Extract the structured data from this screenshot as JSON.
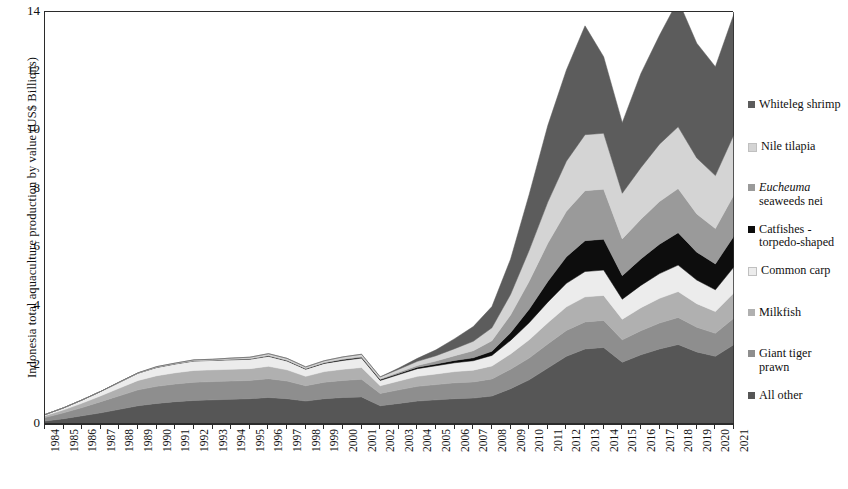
{
  "chart_data": {
    "type": "area",
    "stacked": true,
    "title": "",
    "xlabel": "",
    "ylabel": "Indonesia total aquaculture production by value (US$ Billions)",
    "ylim": [
      0,
      14
    ],
    "yticks": [
      0,
      2,
      4,
      6,
      8,
      10,
      12,
      14
    ],
    "grid": false,
    "legend_position": "right",
    "categories": [
      "1984",
      "1985",
      "1986",
      "1987",
      "1988",
      "1989",
      "1990",
      "1991",
      "1992",
      "1993",
      "1994",
      "1995",
      "1996",
      "1997",
      "1998",
      "1999",
      "2000",
      "2001",
      "2002",
      "2003",
      "2004",
      "2005",
      "2006",
      "2007",
      "2008",
      "2009",
      "2010",
      "2011",
      "2012",
      "2013",
      "2014",
      "2015",
      "2016",
      "2017",
      "2018",
      "2019",
      "2020",
      "2021"
    ],
    "stack_order_bottom_to_top": [
      "All other",
      "Giant tiger prawn",
      "Milkfish",
      "Common carp",
      "Catfishes - torpedo-shaped",
      "Eucheuma seaweeds nei",
      "Nile tilapia",
      "Whiteleg shrimp"
    ],
    "series": [
      {
        "name": "All other",
        "color": "#565656",
        "values": [
          0.1,
          0.18,
          0.28,
          0.38,
          0.5,
          0.62,
          0.7,
          0.76,
          0.8,
          0.82,
          0.84,
          0.86,
          0.9,
          0.86,
          0.78,
          0.86,
          0.9,
          0.92,
          0.62,
          0.7,
          0.78,
          0.82,
          0.86,
          0.88,
          0.95,
          1.2,
          1.5,
          1.9,
          2.3,
          2.55,
          2.6,
          2.1,
          2.35,
          2.55,
          2.7,
          2.45,
          2.3,
          2.7
        ]
      },
      {
        "name": "Giant tiger prawn",
        "color": "#8e8e8e",
        "values": [
          0.12,
          0.2,
          0.28,
          0.38,
          0.46,
          0.54,
          0.58,
          0.6,
          0.62,
          0.62,
          0.62,
          0.62,
          0.64,
          0.6,
          0.52,
          0.56,
          0.58,
          0.6,
          0.42,
          0.46,
          0.5,
          0.52,
          0.54,
          0.55,
          0.58,
          0.66,
          0.74,
          0.82,
          0.88,
          0.92,
          0.92,
          0.76,
          0.82,
          0.88,
          0.92,
          0.84,
          0.78,
          0.9
        ]
      },
      {
        "name": "Milkfish",
        "color": "#b0b0b0",
        "values": [
          0.06,
          0.1,
          0.15,
          0.2,
          0.26,
          0.32,
          0.36,
          0.38,
          0.4,
          0.4,
          0.4,
          0.4,
          0.42,
          0.38,
          0.32,
          0.36,
          0.38,
          0.4,
          0.26,
          0.3,
          0.34,
          0.36,
          0.38,
          0.4,
          0.44,
          0.52,
          0.62,
          0.72,
          0.8,
          0.85,
          0.85,
          0.7,
          0.78,
          0.84,
          0.88,
          0.8,
          0.74,
          0.86
        ]
      },
      {
        "name": "Common carp",
        "color": "#ececec",
        "values": [
          0.04,
          0.07,
          0.11,
          0.15,
          0.2,
          0.25,
          0.28,
          0.3,
          0.32,
          0.32,
          0.32,
          0.32,
          0.34,
          0.3,
          0.24,
          0.28,
          0.3,
          0.32,
          0.18,
          0.22,
          0.26,
          0.28,
          0.3,
          0.32,
          0.36,
          0.46,
          0.58,
          0.7,
          0.8,
          0.86,
          0.86,
          0.68,
          0.76,
          0.84,
          0.9,
          0.8,
          0.74,
          0.88
        ]
      },
      {
        "name": "Catfishes - torpedo-shaped",
        "color": "#0d0d0d",
        "values": [
          0.0,
          0.0,
          0.0,
          0.0,
          0.0,
          0.0,
          0.01,
          0.01,
          0.01,
          0.01,
          0.02,
          0.02,
          0.02,
          0.02,
          0.02,
          0.02,
          0.03,
          0.03,
          0.03,
          0.04,
          0.05,
          0.06,
          0.08,
          0.1,
          0.14,
          0.26,
          0.46,
          0.7,
          0.9,
          1.05,
          1.05,
          0.8,
          0.9,
          1.0,
          1.1,
          0.95,
          0.88,
          1.05
        ]
      },
      {
        "name": "Eucheuma seaweeds nei",
        "color": "#9a9a9a",
        "values": [
          0.0,
          0.0,
          0.0,
          0.0,
          0.0,
          0.0,
          0.0,
          0.0,
          0.0,
          0.0,
          0.0,
          0.0,
          0.01,
          0.01,
          0.01,
          0.01,
          0.02,
          0.02,
          0.02,
          0.04,
          0.06,
          0.1,
          0.16,
          0.24,
          0.36,
          0.6,
          0.95,
          1.3,
          1.55,
          1.7,
          1.7,
          1.25,
          1.35,
          1.45,
          1.5,
          1.3,
          1.2,
          1.4
        ]
      },
      {
        "name": "Nile tilapia",
        "color": "#d4d4d4",
        "values": [
          0.0,
          0.0,
          0.0,
          0.0,
          0.01,
          0.01,
          0.02,
          0.02,
          0.03,
          0.03,
          0.04,
          0.05,
          0.06,
          0.06,
          0.05,
          0.06,
          0.07,
          0.08,
          0.07,
          0.1,
          0.14,
          0.18,
          0.24,
          0.32,
          0.44,
          0.7,
          1.05,
          1.4,
          1.7,
          1.9,
          1.9,
          1.55,
          1.75,
          1.95,
          2.1,
          1.9,
          1.8,
          2.05
        ]
      },
      {
        "name": "Whiteleg shrimp",
        "color": "#5c5c5c",
        "values": [
          0.0,
          0.0,
          0.0,
          0.0,
          0.0,
          0.0,
          0.0,
          0.0,
          0.0,
          0.0,
          0.0,
          0.0,
          0.0,
          0.0,
          0.0,
          0.0,
          0.0,
          0.0,
          0.0,
          0.04,
          0.1,
          0.2,
          0.34,
          0.5,
          0.72,
          1.2,
          1.9,
          2.6,
          3.1,
          3.7,
          2.6,
          2.4,
          3.2,
          3.7,
          4.3,
          3.9,
          3.7,
          4.1
        ]
      }
    ],
    "totals": [
      0.32,
      0.55,
      0.82,
      1.11,
      1.43,
      1.74,
      1.95,
      2.07,
      2.18,
      2.2,
      2.24,
      2.27,
      2.39,
      2.23,
      1.94,
      2.15,
      2.28,
      2.37,
      1.6,
      1.9,
      2.23,
      2.52,
      2.9,
      3.31,
      3.99,
      5.6,
      7.8,
      10.14,
      12.03,
      13.53,
      12.48,
      10.24,
      11.91,
      13.21,
      14.4,
      12.94,
      12.14,
      13.94
    ]
  },
  "legend": {
    "items": [
      {
        "label": "Whiteleg shrimp",
        "label2": "",
        "color": "#5c5c5c"
      },
      {
        "label": "Nile tilapia",
        "label2": "",
        "color": "#d4d4d4"
      },
      {
        "label": "Eucheuma",
        "label2": "seaweeds nei",
        "color": "#9a9a9a",
        "italic_first": true
      },
      {
        "label": "Catfishes -",
        "label2": "torpedo-shaped",
        "color": "#0d0d0d"
      },
      {
        "label": "Common carp",
        "label2": "",
        "color": "#ececec"
      },
      {
        "label": "Milkfish",
        "label2": "",
        "color": "#b0b0b0"
      },
      {
        "label": "Giant tiger",
        "label2": "prawn",
        "color": "#8e8e8e"
      },
      {
        "label": "All other",
        "label2": "",
        "color": "#565656"
      }
    ]
  }
}
